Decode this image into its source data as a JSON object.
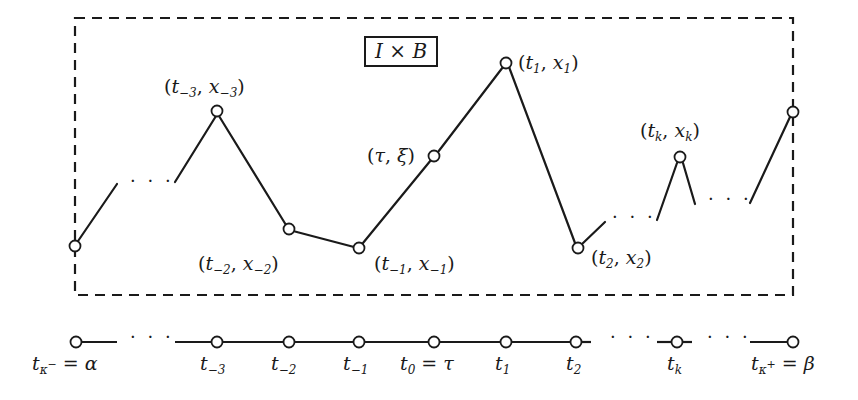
{
  "diagram": {
    "region_label": "I × B",
    "region_label_parts": {
      "left": "I",
      "op": "×",
      "right": "B"
    },
    "path_points": [
      {
        "id": "t_-3",
        "label_t": "t",
        "sub": "−3",
        "label_x": "x",
        "xsub": "−3"
      },
      {
        "id": "t_-2",
        "label_t": "t",
        "sub": "−2",
        "label_x": "x",
        "xsub": "−2"
      },
      {
        "id": "t_-1",
        "label_t": "t",
        "sub": "−1",
        "label_x": "x",
        "xsub": "−1"
      },
      {
        "id": "tau_xi",
        "label_t": "τ",
        "label_x": "ξ"
      },
      {
        "id": "t_1",
        "label_t": "t",
        "sub": "1",
        "label_x": "x",
        "xsub": "1"
      },
      {
        "id": "t_2",
        "label_t": "t",
        "sub": "2",
        "label_x": "x",
        "xsub": "2"
      },
      {
        "id": "t_k",
        "label_t": "t",
        "sub": "k",
        "label_x": "x",
        "xsub": "k"
      }
    ],
    "ellipsis": "· · ·",
    "axis_labels": [
      {
        "t": "t",
        "sub": "κ",
        "sup": "−",
        "eq": "= α"
      },
      {
        "t": "t",
        "sub": "−3"
      },
      {
        "t": "t",
        "sub": "−2"
      },
      {
        "t": "t",
        "sub": "−1"
      },
      {
        "t": "t",
        "sub": "0",
        "eq": "= τ"
      },
      {
        "t": "t",
        "sub": "1"
      },
      {
        "t": "t",
        "sub": "2"
      },
      {
        "t": "t",
        "sub": "k"
      },
      {
        "t": "t",
        "sub": "κ",
        "sup": "+",
        "eq": "= β"
      }
    ],
    "colors": {
      "stroke": "#1a1a1a",
      "background": "#ffffff"
    }
  }
}
